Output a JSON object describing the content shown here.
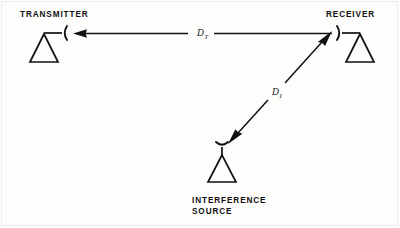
{
  "diagram": {
    "background_color": "#fdfdfc",
    "ink_color": "#111111",
    "nodes": [
      {
        "id": "transmitter",
        "label": "TRANSMITTER",
        "label_x": 20,
        "label_y": 17,
        "antenna_type": "dish-right",
        "mast_x": 44,
        "base_y": 62,
        "arm_y": 33,
        "arm_end_x": 62,
        "triangle_half_width": 14
      },
      {
        "id": "receiver",
        "label": "RECEIVER",
        "label_x": 326,
        "label_y": 17,
        "antenna_type": "dish-left",
        "mast_x": 360,
        "base_y": 62,
        "arm_y": 33,
        "arm_end_x": 342,
        "triangle_half_width": 14
      },
      {
        "id": "interference-source",
        "label_line1": "INTERFERENCE",
        "label_line2": "SOURCE",
        "label_x": 192,
        "label_y1": 203,
        "label_y2": 214,
        "antenna_type": "dish-up",
        "mast_x": 222,
        "base_y": 180,
        "arm_y": 152,
        "triangle_half_width": 14
      }
    ],
    "edges": [
      {
        "id": "transmission-path",
        "label": "D",
        "label_sub": "T",
        "label_x": 197,
        "label_y": 36,
        "from": "receiver",
        "to": "transmitter",
        "arrow": "single",
        "orientation": "horizontal"
      },
      {
        "id": "interference-path",
        "label": "D",
        "label_sub": "I",
        "label_x": 272,
        "label_y": 95,
        "from": "interference-source",
        "to": "receiver",
        "arrow": "double",
        "orientation": "diagonal"
      }
    ]
  }
}
